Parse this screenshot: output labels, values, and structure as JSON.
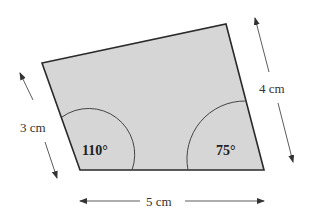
{
  "diagram": {
    "shape": "quadrilateral",
    "fill_color": "#d6d6d6",
    "stroke_color": "#2a2a2a",
    "vertices": {
      "top_left": [
        42,
        63
      ],
      "top_right": [
        226,
        24
      ],
      "bottom_right": [
        264,
        170
      ],
      "bottom_left": [
        80,
        170
      ]
    },
    "labels": {
      "left_side": "3 cm",
      "right_side": "4 cm",
      "bottom_side": "5 cm"
    },
    "angles": {
      "bottom_left": "110°",
      "bottom_right": "75°"
    }
  }
}
